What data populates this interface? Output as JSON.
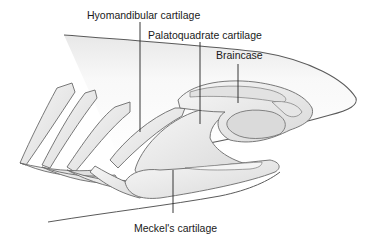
{
  "diagram": {
    "labels": {
      "hyomandibular": "Hyomandibular cartilage",
      "palatoquadrate": "Palatoquadrate cartilage",
      "braincase": "Braincase",
      "meckels": "Meckel's cartilage"
    },
    "colors": {
      "outline": "#5a5a5a",
      "fill_light": "#f2f2f2",
      "fill_mid": "#dcdcdc",
      "leader": "#222222",
      "text": "#1a1a1a"
    }
  }
}
